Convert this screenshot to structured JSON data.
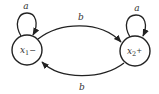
{
  "diagram": {
    "type": "finite-automaton",
    "states": [
      {
        "id": "x1",
        "base": "x",
        "sub": "1",
        "sup": "−",
        "label": "x1−",
        "cx": 27,
        "cy": 50,
        "r": 15
      },
      {
        "id": "x2",
        "base": "x",
        "sub": "2",
        "sup": "+",
        "label": "x2+",
        "cx": 135,
        "cy": 51,
        "r": 15
      }
    ],
    "transitions": [
      {
        "from": "x1",
        "to": "x1",
        "symbol": "a"
      },
      {
        "from": "x2",
        "to": "x2",
        "symbol": "a"
      },
      {
        "from": "x1",
        "to": "x2",
        "symbol": "b"
      },
      {
        "from": "x2",
        "to": "x1",
        "symbol": "b"
      }
    ],
    "labels": {
      "loop_left": "a",
      "loop_right": "a",
      "top_edge": "b",
      "bottom_edge": "b"
    }
  },
  "colors": {
    "stroke": "#222222",
    "text": "#333333",
    "background": "#ffffff"
  }
}
